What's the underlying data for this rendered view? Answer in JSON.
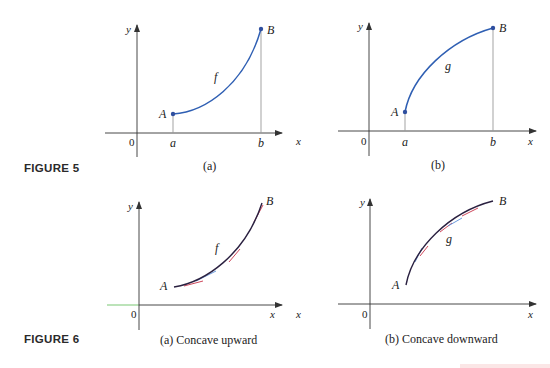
{
  "figure5": {
    "label": "FIGURE 5",
    "panel_a": {
      "caption": "(a)",
      "function_label": "f",
      "point_start": "A",
      "point_end": "B",
      "x_start": "a",
      "x_end": "b",
      "origin": "0",
      "x_axis": "x",
      "y_axis": "y",
      "shape": "increasing, concave upward"
    },
    "panel_b": {
      "caption": "(b)",
      "function_label": "g",
      "point_start": "A",
      "point_end": "B",
      "x_start": "a",
      "x_end": "b",
      "origin": "0",
      "x_axis": "x",
      "y_axis": "y",
      "shape": "increasing, concave downward"
    }
  },
  "figure6": {
    "label": "FIGURE 6",
    "panel_a": {
      "caption": "(a) Concave upward",
      "function_label": "f",
      "point_start": "A",
      "point_end": "B",
      "origin": "0",
      "x_axis": "x",
      "y_axis": "y",
      "tangent_note": "tangent lines lie below the curve"
    },
    "panel_b": {
      "caption": "(b) Concave downward",
      "function_label": "g",
      "point_start": "A",
      "point_end": "B",
      "origin": "0",
      "x_axis": "x",
      "y_axis": "y",
      "tangent_note": "tangent lines lie above the curve"
    }
  },
  "colors": {
    "curve_fig5": "#2f5fb3",
    "curve_fig6": "#2a2040",
    "tangent_red": "#c8334a",
    "tangent_blue": "#5a8fd8",
    "axis": "#333333",
    "guide": "#999999"
  }
}
